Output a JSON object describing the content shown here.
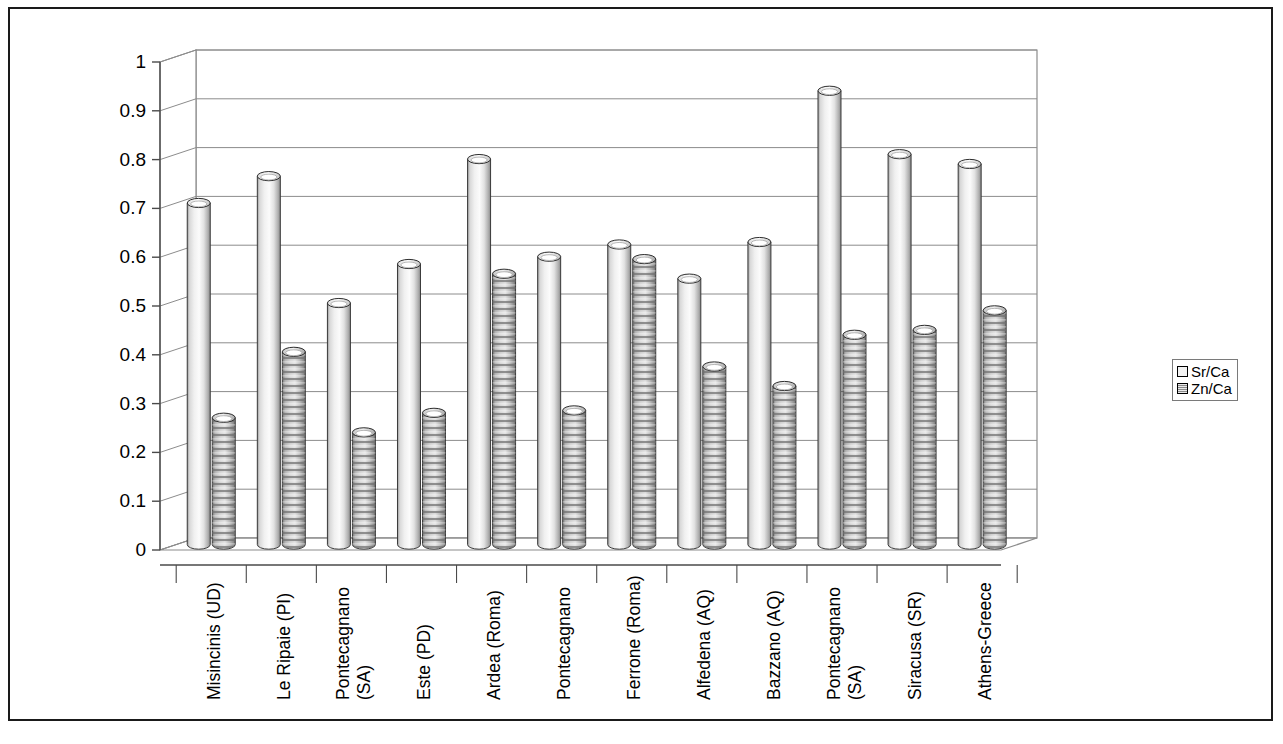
{
  "frame": {
    "border_color": "#1a1a1a",
    "background": "#ffffff"
  },
  "legend": {
    "position": "right",
    "entries": [
      {
        "label": "Sr/Ca",
        "swatch": "light-cylinder-swatch"
      },
      {
        "label": "Zn/Ca",
        "swatch": "striped-cylinder-swatch"
      }
    ]
  },
  "axis": {
    "y_ticks": [
      "0",
      "0.1",
      "0.2",
      "0.3",
      "0.4",
      "0.5",
      "0.6",
      "0.7",
      "0.8",
      "0.9",
      "1"
    ]
  },
  "chart_data": {
    "type": "bar",
    "title": "",
    "subtitle": "",
    "xlabel": "",
    "ylabel": "",
    "ylim": [
      0,
      1
    ],
    "ytick_step": 0.1,
    "grid": true,
    "style": "3d-cylinder",
    "legend_position": "right",
    "categories": [
      "Misincinis (UD)",
      "Le Ripaie (PI)",
      "Pontecagnano\n(SA)",
      "Este (PD)",
      "Ardea (Roma)",
      "Pontecagnano",
      "Ferrone (Roma)",
      "Alfedena (AQ)",
      "Bazzano (AQ)",
      "Pontecagnano\n(SA)",
      "Siracusa (SR)",
      "Athens-Greece"
    ],
    "series": [
      {
        "name": "Sr/Ca",
        "values": [
          0.7,
          0.755,
          0.495,
          0.575,
          0.79,
          0.59,
          0.615,
          0.545,
          0.62,
          0.93,
          0.8,
          0.78
        ]
      },
      {
        "name": "Zn/Ca",
        "values": [
          0.26,
          0.395,
          0.23,
          0.27,
          0.555,
          0.275,
          0.585,
          0.365,
          0.325,
          0.43,
          0.44,
          0.48
        ]
      }
    ]
  }
}
